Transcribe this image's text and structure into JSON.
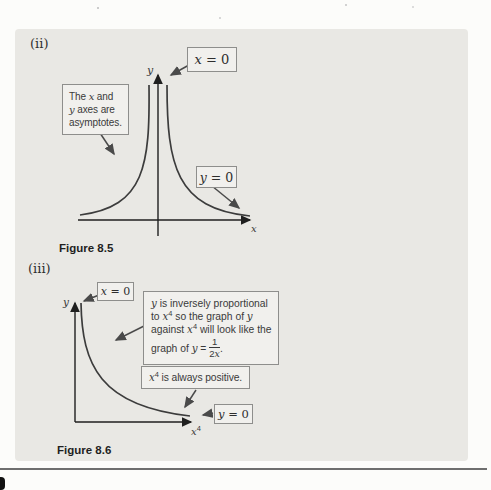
{
  "labels": {
    "part_ii": "(ii)",
    "part_iii": "(iii)",
    "figure85": "Figure 8.5",
    "figure86": "Figure 8.6"
  },
  "fig85": {
    "x_eq_0": {
      "var": "x",
      "rest": " = 0"
    },
    "y_eq_0": {
      "var": "y",
      "rest": " = 0"
    },
    "note": {
      "t1": "The ",
      "x": "x",
      "t2": " and",
      "y": "y",
      "t3": " axes are",
      "t4": "asymptotes."
    },
    "x_axis": "x",
    "y_axis": "y"
  },
  "fig86": {
    "x_eq_0": {
      "var": "x",
      "rest": " = 0"
    },
    "y_eq_0": {
      "var": "y",
      "rest": " = 0"
    },
    "callout": {
      "l1y": "y",
      "l1": " is inversely proportional",
      "l2a": "to ",
      "l2x": "x",
      "l2sup": "4",
      "l2b": " so the graph of ",
      "l2y": "y",
      "l3a": "against ",
      "l3x": "x",
      "l3sup": "4",
      "l3b": " will look like the",
      "l4a": "graph of ",
      "l4y": "y",
      "l4eq": " = ",
      "frac_num": "1",
      "frac_den_coef": "2",
      "frac_den_var": "x",
      "l4end": "."
    },
    "positive": {
      "x": "x",
      "sup": "4",
      "rest": " is always positive."
    },
    "y_axis": "y",
    "x_axis_base": "x",
    "x_axis_sup": "4"
  },
  "colors": {
    "panel_bg": "#e9e8e4",
    "box_bg": "#f1f0ed",
    "box_border": "#8e8e8c",
    "ink": "#3a3a3a",
    "axis": "#1f1f1f",
    "curve": "#3c3c3c",
    "arrow": "#4a4a4a",
    "bottom_rule": "#6e6e6e",
    "tab": "#111111"
  }
}
